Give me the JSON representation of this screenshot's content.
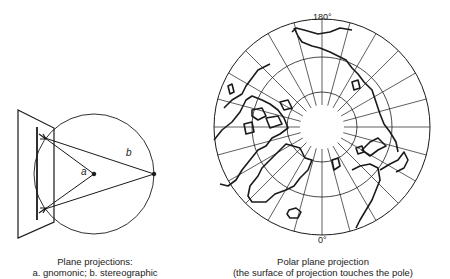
{
  "left_figure": {
    "label_a": "a",
    "label_b": "b",
    "caption_line1": "Plane projections:",
    "caption_line2": "a. gnomonic; b.  stereographic"
  },
  "right_figure": {
    "top_label": "180°",
    "bottom_label": "0°",
    "caption_line1": "Polar plane projection",
    "caption_line2": "(the surface of projection touches the pole)",
    "meridian_step_degrees": 15,
    "ring_count": 3
  },
  "colors": {
    "line": "#1a1a1a",
    "background": "#ffffff"
  }
}
